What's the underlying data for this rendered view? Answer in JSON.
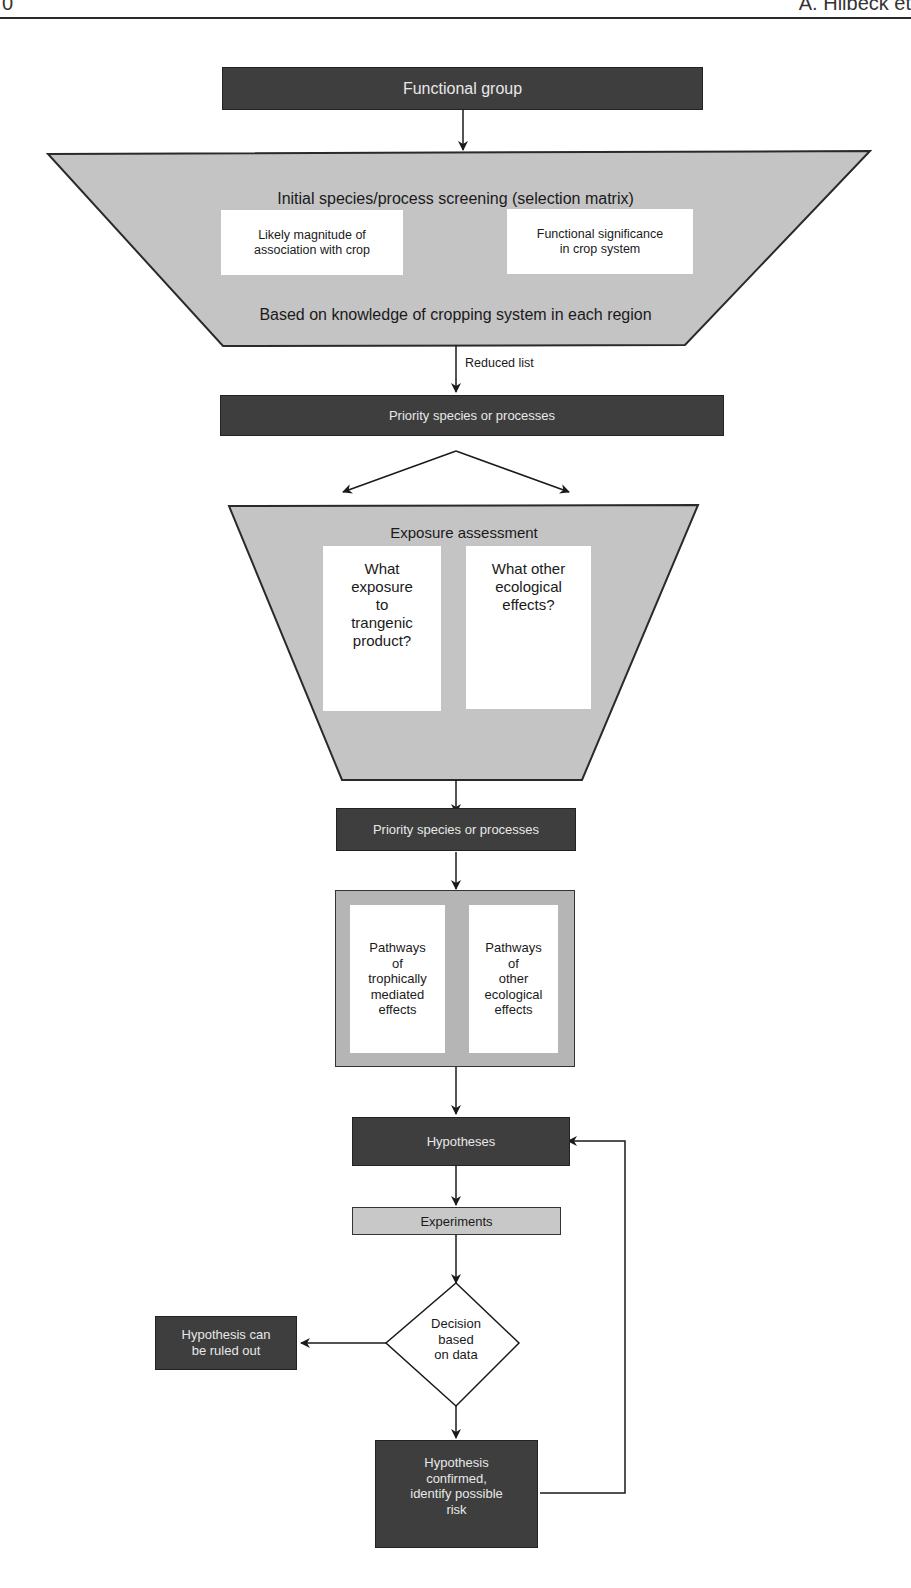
{
  "page_header": {
    "page_number": "0",
    "running_head": "A. Hilbeck et"
  },
  "colors": {
    "dark_box": "#3e3e3e",
    "light_box": "#c8c8c8",
    "funnel_fill": "#c4c4c4",
    "frame_fill": "#b5b5b5",
    "line": "#1a1a1a"
  },
  "diagram": {
    "functional_group": "Functional group",
    "screening": {
      "title": "Initial species/process screening (selection matrix)",
      "left_box": "Likely magnitude of\nassociation with crop",
      "right_box": "Functional significance\nin crop system",
      "footer": "Based on knowledge of cropping system in each region"
    },
    "reduced_list_label": "Reduced list",
    "priority_1": "Priority species or processes",
    "exposure": {
      "title": "Exposure assessment",
      "left_box": "What\nexposure\nto\ntrangenic\nproduct?",
      "right_box": "What other\necological\neffects?"
    },
    "priority_2": "Priority species or processes",
    "pathways": {
      "left_box": "Pathways\nof\ntrophically\nmediated\neffects",
      "right_box": "Pathways\nof\nother\necological\neffects"
    },
    "hypotheses": "Hypotheses",
    "experiments": "Experiments",
    "decision": "Decision\nbased\non data",
    "ruled_out": "Hypothesis can\nbe ruled out",
    "confirmed": "Hypothesis\nconfirmed,\nidentify possible\nrisk"
  }
}
